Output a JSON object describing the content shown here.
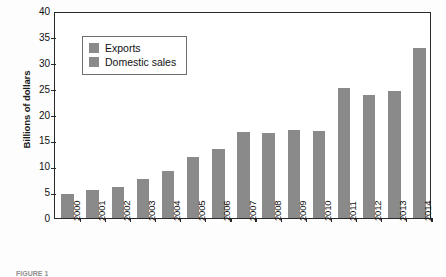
{
  "chart_data": {
    "type": "bar",
    "title": "",
    "subtitle": "",
    "xlabel": "",
    "ylabel": "Billions of dollars",
    "categories": [
      "2000",
      "2001",
      "2002",
      "2003",
      "2004",
      "2005",
      "2006",
      "2007",
      "2008",
      "2009",
      "2010",
      "2011",
      "2012",
      "2013",
      "2014"
    ],
    "values": [
      4.6,
      5.5,
      6.0,
      7.5,
      9.1,
      11.8,
      13.3,
      16.6,
      16.5,
      17.0,
      16.9,
      25.1,
      23.8,
      24.5,
      32.8
    ],
    "series": [
      {
        "name": "Domestic sales",
        "values": [
          4.6,
          5.5,
          6.0,
          7.5,
          9.1,
          11.8,
          13.3,
          16.6,
          16.5,
          17.0,
          16.9,
          25.1,
          23.8,
          24.5,
          32.8
        ]
      }
    ],
    "ylim": [
      0,
      40
    ],
    "y_ticks": [
      0,
      5,
      10,
      15,
      20,
      25,
      30,
      35,
      40
    ],
    "y_tick_labels": [
      "0",
      "5",
      "10",
      "15",
      "20",
      "25",
      "30",
      "35",
      "40"
    ],
    "grid": false,
    "legend_position": "upper-left",
    "bar_color": "#8a8a8a",
    "axis_color": "#2a2a2a",
    "background_color": "#ffffff"
  },
  "legend": {
    "entries": [
      {
        "label": "Exports",
        "color": "#8a8a8a"
      },
      {
        "label": "Domestic sales",
        "color": "#8a8a8a"
      }
    ]
  },
  "caption": {
    "text": "FIGURE 1"
  }
}
